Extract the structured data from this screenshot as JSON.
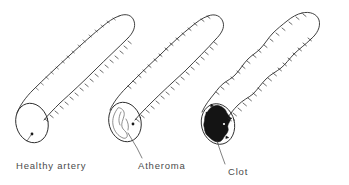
{
  "figure": {
    "background_color": "#ffffff",
    "ink_color": "#2b2b2b",
    "clot_color": "#141414",
    "width": 349,
    "height": 185
  },
  "labels": {
    "healthy": "Healthy artery",
    "atheroma": "Atheroma",
    "clot": "Clot"
  },
  "specimens": [
    {
      "name": "healthy-artery",
      "label": "Healthy artery",
      "description": "Smooth tapering tube with open round lumen",
      "lumen_state": "open",
      "has_plaque": false,
      "has_clot": false
    },
    {
      "name": "atheroma-artery",
      "label": "Atheroma",
      "description": "Tube with fatty plaque deposit narrowing the lumen",
      "lumen_state": "narrowed",
      "has_plaque": true,
      "has_clot": false
    },
    {
      "name": "clot-artery",
      "label": "Clot",
      "description": "Bumpy irregular tube fully occluded by a dark blood clot",
      "lumen_state": "occluded",
      "has_plaque": true,
      "has_clot": true
    }
  ]
}
